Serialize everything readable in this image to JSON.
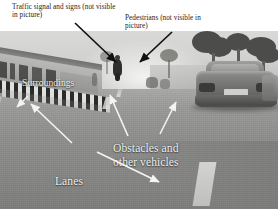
{
  "figure": {
    "type": "annotated-photograph"
  },
  "captions": [
    {
      "id": "traffic-signal",
      "text": "Traffic signal and signs (not visible in picture)",
      "color": "#1a1a1a",
      "placement": "above-photo-left",
      "arrow": "black"
    },
    {
      "id": "pedestrians",
      "text": "Pedestrians (not visible in picture)",
      "color": "#1a1a1a",
      "placement": "above-photo-right",
      "arrow": "black"
    }
  ],
  "overlay_labels": [
    {
      "id": "surroundings",
      "text": "Surroundings",
      "color": "#f2f2f0",
      "arrow": "white",
      "points_to": "roadside-wall-and-kerb"
    },
    {
      "id": "obstacles",
      "text": "Obstacles and\nother vehicles",
      "color": "#f2f2f0",
      "arrow": "white",
      "points_to": "motorcyclist-and-car"
    },
    {
      "id": "lanes",
      "text": "Lanes",
      "color": "#f2f2f0",
      "arrow": "white",
      "points_to": "lane-marking"
    },
    {
      "id": "road",
      "text": "Road",
      "color": "#f2f2f0",
      "arrow": "none",
      "points_to": "road-surface"
    }
  ],
  "scene_objects": [
    "motorcyclist",
    "car",
    "trees",
    "roadside-hoarding",
    "black-white-striped-kerb",
    "lane-marking",
    "hazy-sky"
  ],
  "palette": {
    "background": "#ffffff",
    "caption_text": "#1a1a1a",
    "overlay_text": "#f2f2f0",
    "road": "#8e8e8c",
    "sky": "#d2d2d0",
    "arrow_black": "#111111",
    "arrow_white": "#f4f4f2"
  }
}
